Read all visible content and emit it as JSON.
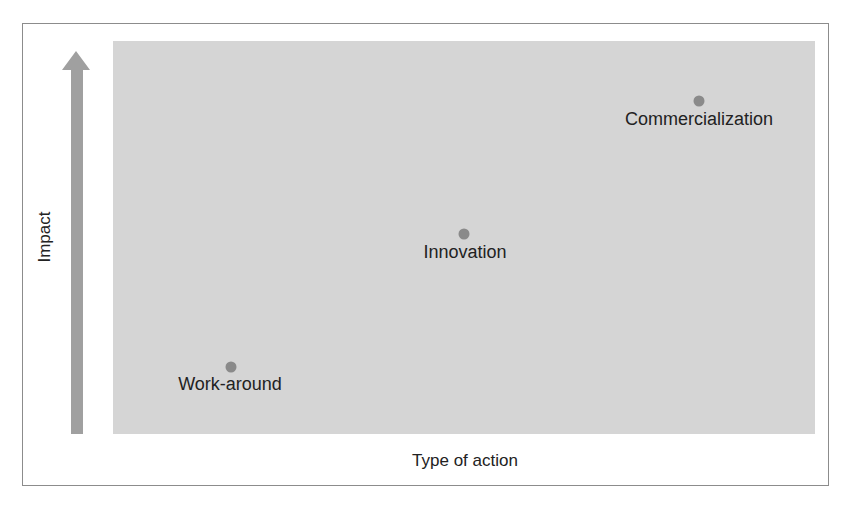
{
  "diagram": {
    "y_axis_label": "Impact",
    "x_axis_label": "Type of action",
    "arrow_direction": "up",
    "colors": {
      "plot_background": "#d5d5d5",
      "arrow": "#a0a0a0",
      "point": "#8a8a8a",
      "frame": "#8c8c8c",
      "text": "#222222"
    },
    "points": [
      {
        "label": "Work-around",
        "impact": "low",
        "position_rank": 1
      },
      {
        "label": "Innovation",
        "impact": "medium",
        "position_rank": 2
      },
      {
        "label": "Commercialization",
        "impact": "high",
        "position_rank": 3
      }
    ]
  }
}
